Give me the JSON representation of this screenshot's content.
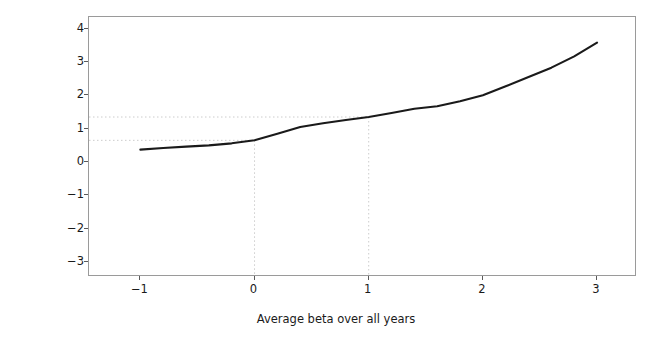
{
  "chart_data": {
    "type": "line",
    "title": "",
    "xlabel": "Average beta over all years",
    "ylabel": "Average monthly RoR, in %",
    "xlim": [
      -1.45,
      3.35
    ],
    "ylim": [
      -3.45,
      4.35
    ],
    "xticks": [
      -1,
      0,
      1,
      2,
      3
    ],
    "xticklabels": [
      "−1",
      "0",
      "1",
      "2",
      "3"
    ],
    "yticks": [
      -3,
      -2,
      -1,
      0,
      1,
      2,
      3,
      4
    ],
    "yticklabels": [
      "−3",
      "−2",
      "−1",
      "0",
      "1",
      "2",
      "3",
      "4"
    ],
    "grid": false,
    "legend": null,
    "line_color": "#1a1a1a",
    "guide_color": "#cccccc",
    "guides": {
      "vertical_x": [
        0,
        1
      ],
      "horizontal_y": [
        0.65,
        1.35
      ]
    },
    "x": [
      -1.0,
      -0.8,
      -0.6,
      -0.4,
      -0.2,
      0.0,
      0.2,
      0.4,
      0.6,
      0.8,
      1.0,
      1.2,
      1.4,
      1.6,
      1.8,
      2.0,
      2.2,
      2.4,
      2.6,
      2.8,
      3.0
    ],
    "y": [
      0.37,
      0.42,
      0.46,
      0.5,
      0.56,
      0.65,
      0.85,
      1.05,
      1.16,
      1.26,
      1.35,
      1.47,
      1.6,
      1.67,
      1.82,
      2.0,
      2.27,
      2.55,
      2.83,
      3.17,
      3.58
    ]
  }
}
